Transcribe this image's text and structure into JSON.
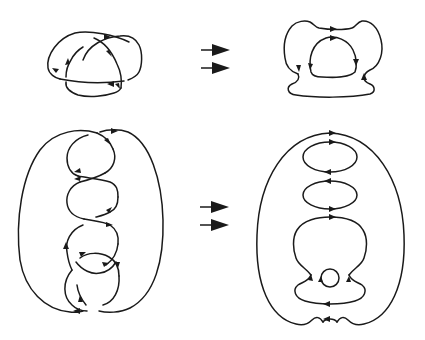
{
  "figure": {
    "type": "knot-diagram-transformation",
    "rows": [
      {
        "name": "top-row",
        "left": "trefoil-knot-diagram-with-oriented-arcs",
        "transition": "double-arrow",
        "right": "seifert-circle-smoothing-result"
      },
      {
        "name": "bottom-row",
        "left": "twisted-chain-knot-diagram-with-oriented-arcs",
        "transition": "double-arrow",
        "right": "seifert-circle-smoothing-result"
      }
    ]
  },
  "colors": {
    "background": "#ffffff",
    "stroke": "#1a1a1a"
  }
}
